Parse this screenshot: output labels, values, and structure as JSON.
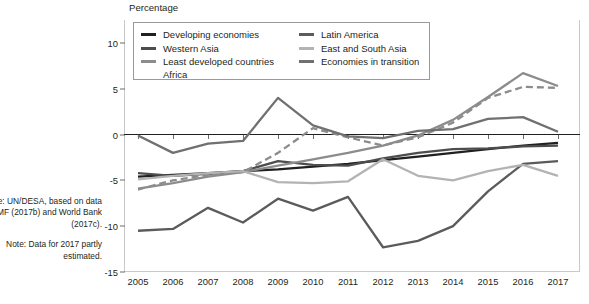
{
  "axis_title": "Percentage",
  "sidenotes": {
    "source": "Source: UN/DESA, based on data from IMF (2017b) and World Bank (2017c).",
    "note": "Note: Data for 2017 partly estimated."
  },
  "colors": {
    "developing": "#231f20",
    "western_asia": "#4d4d4d",
    "ldc": "#8c8c8c",
    "africa": "#8c8c8c",
    "latin_america": "#5b5b5b",
    "east_south_asia": "#b3b3b3",
    "transition": "#707070",
    "zero_line": "#231f20",
    "grid": "#c9c9c9",
    "frame": "#9a9a9a"
  },
  "chart_data": {
    "type": "line",
    "title": "",
    "subtitle": "",
    "xlabel": "",
    "ylabel": "Percentage",
    "ylim": [
      -15,
      12.5
    ],
    "yticks": [
      10,
      5,
      0,
      -5,
      -10,
      -15
    ],
    "grid": false,
    "legend_position": "top-left-inside",
    "x": [
      2005,
      2006,
      2007,
      2008,
      2009,
      2010,
      2011,
      2012,
      2013,
      2014,
      2015,
      2016,
      2017
    ],
    "categories": [
      "2005",
      "2006",
      "2007",
      "2008",
      "2009",
      "2010",
      "2011",
      "2012",
      "2013",
      "2014",
      "2015",
      "2016",
      "2017"
    ],
    "series": [
      {
        "name": "Developing economies",
        "color": "#231f20",
        "style": "solid",
        "values": [
          -4.6,
          -4.4,
          -4.2,
          -4.0,
          -3.8,
          -3.5,
          -3.2,
          -2.8,
          -2.4,
          -2.0,
          -1.6,
          -1.2,
          -0.9
        ]
      },
      {
        "name": "Western Asia",
        "color": "#4d4d4d",
        "style": "solid",
        "values": [
          -4.2,
          -4.5,
          -4.3,
          -4.0,
          -2.9,
          -3.3,
          -3.4,
          -2.6,
          -2.0,
          -1.6,
          -1.5,
          -1.3,
          -1.2
        ]
      },
      {
        "name": "Least developed countries",
        "color": "#8c8c8c",
        "style": "solid",
        "values": [
          -5.9,
          -5.3,
          -4.6,
          -4.1,
          -3.4,
          -2.7,
          -2.0,
          -1.2,
          -0.1,
          1.6,
          4.1,
          6.7,
          5.3
        ]
      },
      {
        "name": "Africa",
        "color": "#8c8c8c",
        "style": "dashed",
        "values": [
          -6.0,
          -5.0,
          -4.4,
          -4.1,
          -2.0,
          0.7,
          -0.3,
          -1.2,
          -0.3,
          1.3,
          4.0,
          5.2,
          5.1
        ]
      },
      {
        "name": "Latin America",
        "color": "#5b5b5b",
        "style": "solid",
        "values": [
          -10.5,
          -10.3,
          -8.0,
          -9.6,
          -7.0,
          -8.3,
          -6.8,
          -12.3,
          -11.6,
          -10.0,
          -6.2,
          -3.2,
          -2.9
        ]
      },
      {
        "name": "East and South Asia",
        "color": "#b3b3b3",
        "style": "solid",
        "values": [
          -4.9,
          -4.5,
          -4.2,
          -4.0,
          -5.2,
          -5.3,
          -5.1,
          -2.7,
          -4.5,
          -5.0,
          -4.0,
          -3.3,
          -4.5
        ]
      },
      {
        "name": "Economies in transition",
        "color": "#707070",
        "style": "solid",
        "values": [
          -0.1,
          -2.0,
          -1.0,
          -0.7,
          4.0,
          1.0,
          -0.2,
          -0.4,
          0.4,
          0.6,
          1.7,
          1.9,
          0.3
        ]
      }
    ]
  },
  "legend": {
    "columns": [
      [
        {
          "label": "Developing economies",
          "color": "#231f20",
          "style": "solid"
        },
        {
          "label": "Western Asia",
          "color": "#4d4d4d",
          "style": "solid"
        },
        {
          "label": "Least developed countries",
          "color": "#8c8c8c",
          "style": "solid"
        },
        {
          "label": "Africa",
          "color": "#8c8c8c",
          "style": "dashed"
        }
      ],
      [
        {
          "label": "Latin America",
          "color": "#5b5b5b",
          "style": "solid"
        },
        {
          "label": "East and South Asia",
          "color": "#b3b3b3",
          "style": "solid"
        },
        {
          "label": "Economies in transition",
          "color": "#707070",
          "style": "solid"
        }
      ]
    ]
  }
}
